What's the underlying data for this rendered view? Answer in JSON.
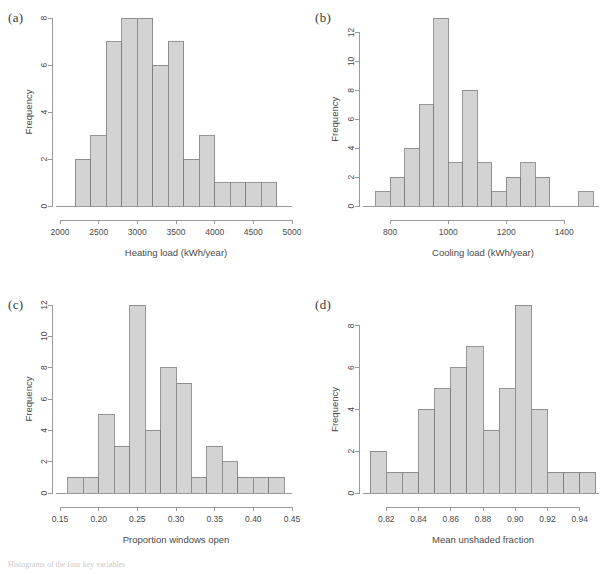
{
  "figure": {
    "caption_fragment": "Histograms of the four key variables"
  },
  "panels": [
    {
      "tag": "(a)",
      "ylabel": "Frequency",
      "xlabel": "Heating load (kWh/year)"
    },
    {
      "tag": "(b)",
      "ylabel": "Frequency",
      "xlabel": "Cooling load (kWh/year)"
    },
    {
      "tag": "(c)",
      "ylabel": "Frequency",
      "xlabel": "Proportion windows open"
    },
    {
      "tag": "(d)",
      "ylabel": "Frequency",
      "xlabel": "Mean unshaded fraction"
    }
  ],
  "chart_data": [
    {
      "type": "bar",
      "panel": "(a)",
      "title": "",
      "xlabel": "Heating load (kWh/year)",
      "ylabel": "Frequency",
      "bin_width": 200,
      "bin_edges": [
        2200,
        2400,
        2600,
        2800,
        3000,
        3200,
        3400,
        3600,
        3800,
        4000,
        4200,
        4400,
        4600,
        4800
      ],
      "categories": [
        "2200-2400",
        "2400-2600",
        "2600-2800",
        "2800-3000",
        "3000-3200",
        "3200-3400",
        "3400-3600",
        "3600-3800",
        "3800-4000",
        "4000-4200",
        "4200-4400",
        "4400-4600",
        "4600-4800"
      ],
      "values": [
        2,
        3,
        7,
        8,
        8,
        6,
        7,
        2,
        3,
        1,
        1,
        1,
        1
      ],
      "xlim": [
        2000,
        5000
      ],
      "ylim": [
        0,
        8
      ],
      "xticks": [
        2000,
        2500,
        3000,
        3500,
        4000,
        4500,
        5000
      ],
      "xticklabels": [
        "2000",
        "2500",
        "3000",
        "3500",
        "4000",
        "4500",
        "5000"
      ],
      "yticks": [
        0,
        2,
        4,
        6,
        8
      ],
      "yticklabels": [
        "0",
        "2",
        "4",
        "6",
        "8"
      ],
      "grid": false,
      "legend": false
    },
    {
      "type": "bar",
      "panel": "(b)",
      "title": "",
      "xlabel": "Cooling load (kWh/year)",
      "ylabel": "Frequency",
      "bin_width": 50,
      "bin_edges": [
        750,
        800,
        850,
        900,
        950,
        1000,
        1050,
        1100,
        1150,
        1200,
        1250,
        1300,
        1350,
        1400,
        1450,
        1500
      ],
      "categories": [
        "750-800",
        "800-850",
        "850-900",
        "900-950",
        "950-1000",
        "1000-1050",
        "1050-1100",
        "1100-1150",
        "1150-1200",
        "1200-1250",
        "1250-1300",
        "1300-1350",
        "1350-1400",
        "1400-1450",
        "1450-1500"
      ],
      "values": [
        1,
        2,
        4,
        7,
        13,
        3,
        8,
        3,
        1,
        2,
        3,
        2,
        0,
        0,
        1
      ],
      "xlim": [
        720,
        1520
      ],
      "ylim": [
        0,
        13
      ],
      "xticks": [
        800,
        1000,
        1200,
        1400
      ],
      "xticklabels": [
        "800",
        "1000",
        "1200",
        "1400"
      ],
      "yticks": [
        0,
        2,
        4,
        6,
        8,
        10,
        12
      ],
      "yticklabels": [
        "0",
        "2",
        "4",
        "6",
        "8",
        "10",
        "12"
      ],
      "grid": false,
      "legend": false
    },
    {
      "type": "bar",
      "panel": "(c)",
      "title": "",
      "xlabel": "Proportion windows open",
      "ylabel": "Frequency",
      "bin_width": 0.02,
      "bin_edges": [
        0.16,
        0.18,
        0.2,
        0.22,
        0.24,
        0.26,
        0.28,
        0.3,
        0.32,
        0.34,
        0.36,
        0.38,
        0.4,
        0.42,
        0.44
      ],
      "categories": [
        "0.16-0.18",
        "0.18-0.20",
        "0.20-0.22",
        "0.22-0.24",
        "0.24-0.26",
        "0.26-0.28",
        "0.28-0.30",
        "0.30-0.32",
        "0.32-0.34",
        "0.34-0.36",
        "0.36-0.38",
        "0.38-0.40",
        "0.40-0.42",
        "0.42-0.44"
      ],
      "values": [
        1,
        1,
        5,
        3,
        12,
        4,
        8,
        7,
        1,
        3,
        2,
        1,
        1,
        1
      ],
      "xlim": [
        0.15,
        0.45
      ],
      "ylim": [
        0,
        12
      ],
      "xticks": [
        0.15,
        0.2,
        0.25,
        0.3,
        0.35,
        0.4,
        0.45
      ],
      "xticklabels": [
        "0.15",
        "0.20",
        "0.25",
        "0.30",
        "0.35",
        "0.40",
        "0.45"
      ],
      "yticks": [
        0,
        2,
        4,
        6,
        8,
        10,
        12
      ],
      "yticklabels": [
        "0",
        "2",
        "4",
        "6",
        "8",
        "10",
        "12"
      ],
      "grid": false,
      "legend": false
    },
    {
      "type": "bar",
      "panel": "(d)",
      "title": "",
      "xlabel": "Mean unshaded fraction",
      "ylabel": "Frequency",
      "bin_width": 0.01,
      "bin_edges": [
        0.81,
        0.82,
        0.83,
        0.84,
        0.85,
        0.86,
        0.87,
        0.88,
        0.89,
        0.9,
        0.91,
        0.92,
        0.93,
        0.94,
        0.95
      ],
      "categories": [
        "0.81-0.82",
        "0.82-0.83",
        "0.83-0.84",
        "0.84-0.85",
        "0.85-0.86",
        "0.86-0.87",
        "0.87-0.88",
        "0.88-0.89",
        "0.89-0.90",
        "0.90-0.91",
        "0.91-0.92",
        "0.92-0.93",
        "0.93-0.94",
        "0.94-0.95"
      ],
      "values": [
        2,
        1,
        1,
        4,
        5,
        6,
        7,
        3,
        5,
        9,
        4,
        1,
        1,
        1
      ],
      "xlim": [
        0.808,
        0.952
      ],
      "ylim": [
        0,
        9
      ],
      "xticks": [
        0.82,
        0.84,
        0.86,
        0.88,
        0.9,
        0.92,
        0.94
      ],
      "xticklabels": [
        "0.82",
        "0.84",
        "0.86",
        "0.88",
        "0.90",
        "0.92",
        "0.94"
      ],
      "yticks": [
        0,
        2,
        4,
        6,
        8
      ],
      "yticklabels": [
        "0",
        "2",
        "4",
        "6",
        "8"
      ],
      "grid": false,
      "legend": false
    }
  ],
  "colors": {
    "bar_fill": "#d3d3d3",
    "bar_stroke": "#7d7d7d",
    "axis": "#9a9a9a",
    "text": "#4a4a4a",
    "background": "#ffffff"
  }
}
